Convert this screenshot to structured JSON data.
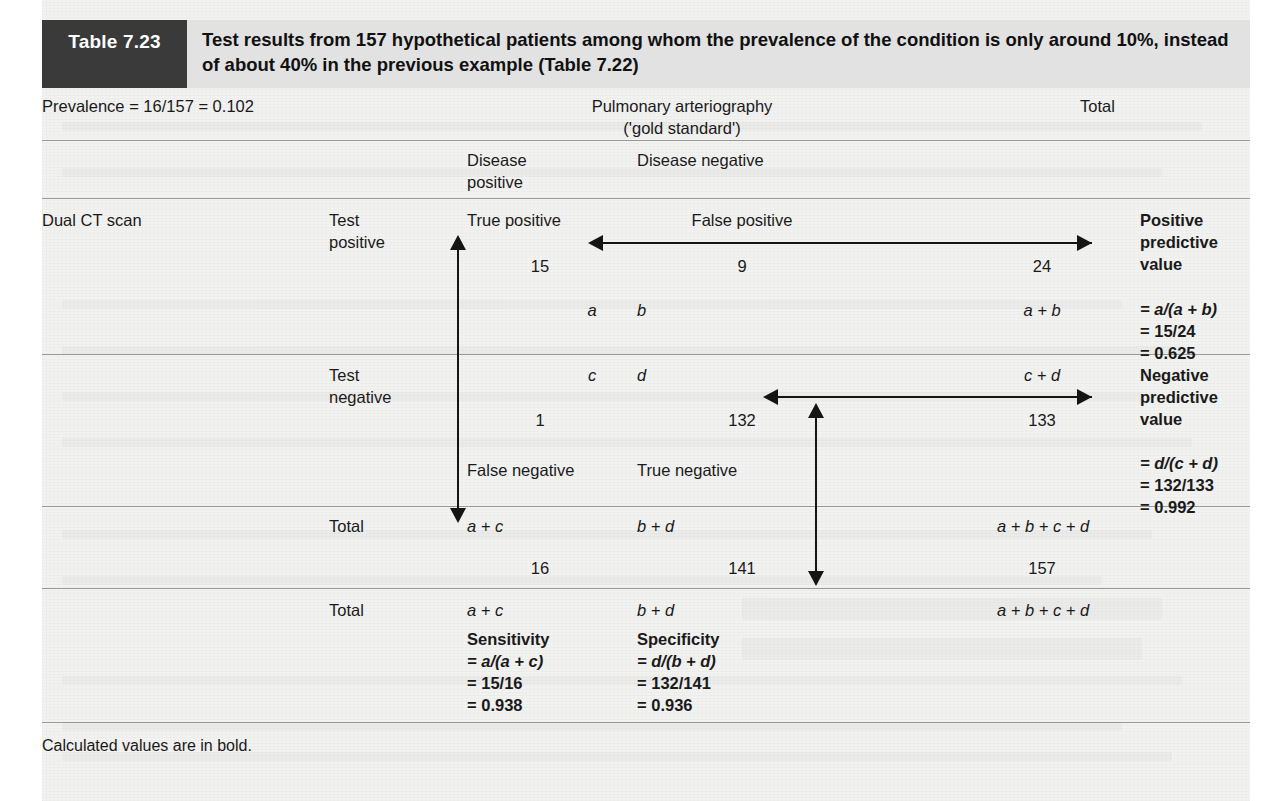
{
  "header": {
    "table_number": "Table 7.23",
    "title": "Test results from 157 hypothetical patients among whom the prevalence of the condition is only around 10%, instead of about 40% in the previous example (Table 7.22)",
    "number_box_color": "#3a3a3a",
    "band_color": "#e2e2e2"
  },
  "top_row": {
    "prevalence": "Prevalence = 16/157 = 0.102",
    "column_group_heading": "Pulmonary arteriography\n('gold standard')",
    "total_heading": "Total"
  },
  "column_headers": {
    "disease_positive": "Disease\npositive",
    "disease_negative": "Disease negative"
  },
  "row_labels": {
    "test_name": "Dual CT scan",
    "test_positive": "Test\npositive",
    "test_negative": "Test\nnegative",
    "total_1": "Total",
    "total_2": "Total"
  },
  "test_positive_row": {
    "true_positive_label": "True positive",
    "false_positive_label": "False positive",
    "true_positive_count": "15",
    "false_positive_count": "9",
    "row_total_count": "24",
    "symbol_a": "a",
    "symbol_b": "b",
    "symbol_a_plus_b": "a + b",
    "ppv": {
      "title": "Positive\npredictive\nvalue",
      "formula": "= a/(a + b)",
      "substitution": "= 15/24",
      "result": "= 0.625"
    }
  },
  "test_negative_row": {
    "symbol_c": "c",
    "symbol_d": "d",
    "symbol_c_plus_d": "c + d",
    "false_negative_count": "1",
    "true_negative_count": "132",
    "row_total_count": "133",
    "false_negative_label": "False negative",
    "true_negative_label": "True negative",
    "npv": {
      "title": "Negative\npredictive\nvalue",
      "formula": "= d/(c + d)",
      "substitution": "= 132/133",
      "result": "= 0.992"
    }
  },
  "total_row_1": {
    "symbol_a_plus_c": "a + c",
    "symbol_b_plus_d": "b + d",
    "symbol_grand": "a + b + c + d",
    "disease_positive_total": "16",
    "disease_negative_total": "141",
    "grand_total": "157"
  },
  "total_row_2": {
    "symbol_a_plus_c": "a + c",
    "symbol_b_plus_d": "b + d",
    "symbol_grand": "a + b + c + d",
    "sensitivity": {
      "title": "Sensitivity",
      "formula": "= a/(a + c)",
      "substitution": "= 15/16",
      "result": "= 0.938"
    },
    "specificity": {
      "title": "Specificity",
      "formula": "= d/(b + d)",
      "substitution": "= 132/141",
      "result": "= 0.936"
    }
  },
  "footnote": "Calculated values are in bold."
}
